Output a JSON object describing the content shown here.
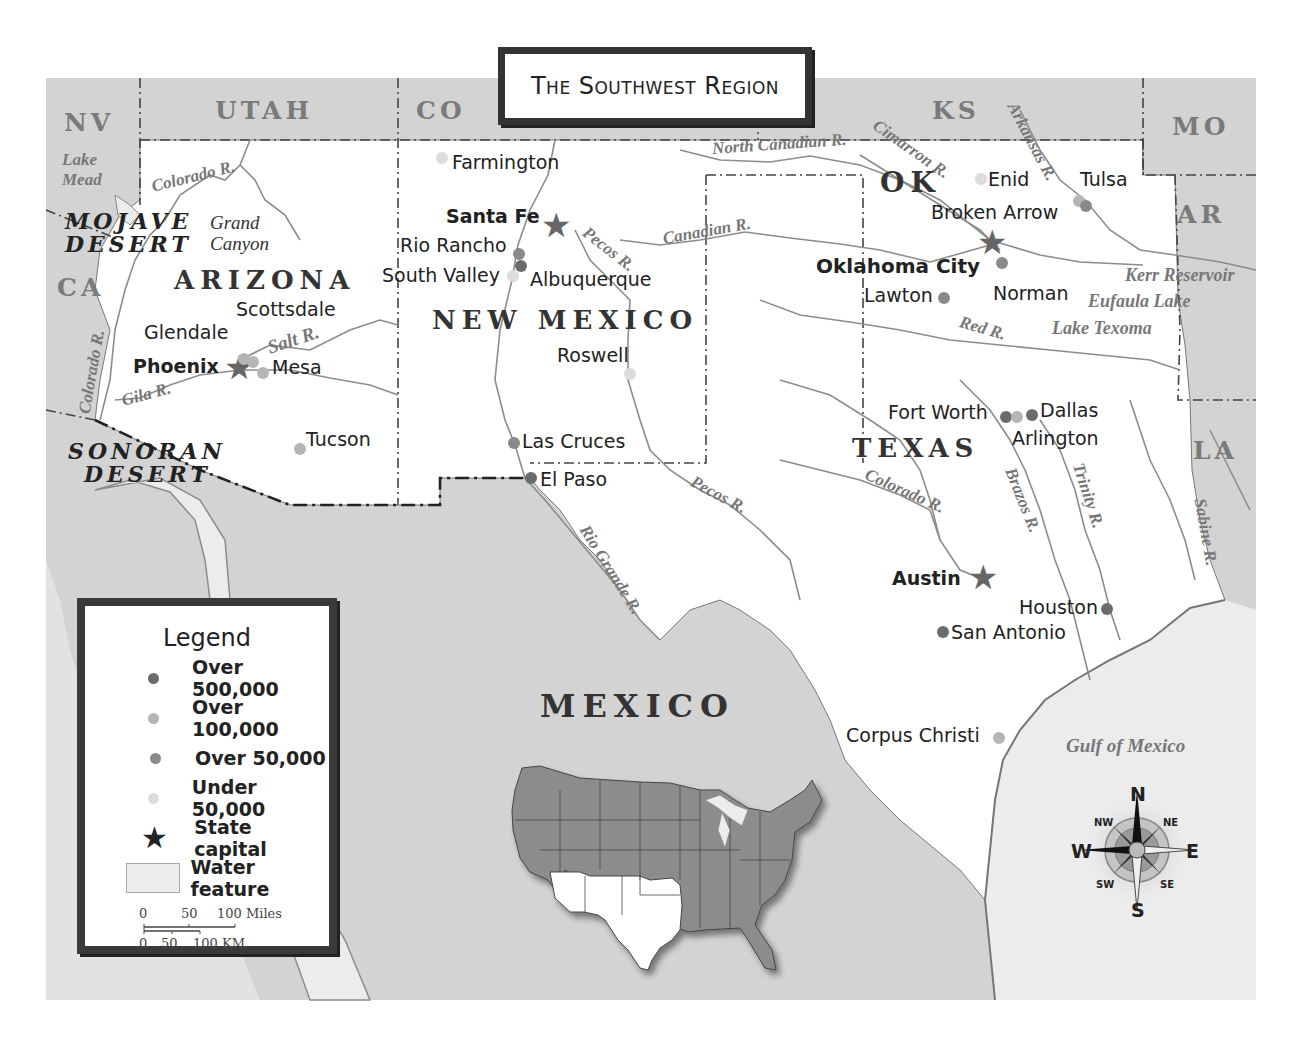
{
  "title": "The Southwest Region",
  "colors": {
    "outside_land": "#d3d3d3",
    "region_land": "#ffffff",
    "water": "#ececec",
    "river": "#8c8c8c",
    "border": "#444444",
    "dot_over_500000": "#6b6b6b",
    "dot_over_100000": "#b5b5b5",
    "dot_over_50000": "#8a8a8a",
    "dot_under_50000": "#dcdcdc",
    "capital_star": "#666666"
  },
  "neighbor_states": {
    "nv": "NV",
    "utah": "UTAH",
    "co": "CO",
    "ks": "KS",
    "mo": "MO",
    "ar": "AR",
    "la": "LA",
    "ca": "CA"
  },
  "region_states": {
    "arizona": "ARIZONA",
    "new_mexico": "NEW MEXICO",
    "ok": "OK",
    "texas": "TEXAS"
  },
  "country": "MEXICO",
  "deserts": {
    "mojave": [
      "MOJAVE",
      "DESERT"
    ],
    "sonoran": [
      "SONORAN",
      "DESERT"
    ]
  },
  "features": {
    "grand_canyon": [
      "Grand",
      "Canyon"
    ],
    "lake_mead": [
      "Lake",
      "Mead"
    ]
  },
  "rivers": {
    "colorado_az": "Colorado R.",
    "colorado_west": "Colorado R.",
    "gila": "Gila R.",
    "salt": "Salt R.",
    "pecos_nm": "Pecos R.",
    "pecos_tx": "Pecos R.",
    "rio_grande": "Rio Grande R.",
    "canadian": "Canadian R.",
    "north_canadian": "North Canadian R.",
    "cimarron": "Cimarron R.",
    "arkansas": "Arkansas R.",
    "red": "Red R.",
    "colorado_tx": "Colorado R.",
    "brazos": "Brazos R.",
    "trinity": "Trinity R.",
    "sabine": "Sabine R."
  },
  "water_bodies": {
    "kerr": "Kerr Reservoir",
    "eufaula": "Eufaula Lake",
    "texoma": "Lake Texoma",
    "gulf": "Gulf of Mexico"
  },
  "cities": {
    "phoenix": {
      "name": "Phoenix",
      "tier": "capital"
    },
    "glendale": {
      "name": "Glendale",
      "tier": "over_100000"
    },
    "scottsdale": {
      "name": "Scottsdale",
      "tier": "over_100000"
    },
    "mesa": {
      "name": "Mesa",
      "tier": "over_100000"
    },
    "tucson": {
      "name": "Tucson",
      "tier": "over_100000"
    },
    "farmington": {
      "name": "Farmington",
      "tier": "under_50000"
    },
    "santa_fe": {
      "name": "Santa Fe",
      "tier": "capital"
    },
    "rio_rancho": {
      "name": "Rio Rancho",
      "tier": "over_50000"
    },
    "south_valley": {
      "name": "South Valley",
      "tier": "under_50000"
    },
    "albuquerque": {
      "name": "Albuquerque",
      "tier": "over_500000"
    },
    "roswell": {
      "name": "Roswell",
      "tier": "under_50000"
    },
    "las_cruces": {
      "name": "Las Cruces",
      "tier": "over_50000"
    },
    "el_paso": {
      "name": "El Paso",
      "tier": "over_500000"
    },
    "enid": {
      "name": "Enid",
      "tier": "under_50000"
    },
    "tulsa": {
      "name": "Tulsa",
      "tier": "over_100000"
    },
    "broken_arrow": {
      "name": "Broken Arrow",
      "tier": "over_50000"
    },
    "oklahoma_city": {
      "name": "Oklahoma City",
      "tier": "capital"
    },
    "norman": {
      "name": "Norman",
      "tier": "over_50000"
    },
    "lawton": {
      "name": "Lawton",
      "tier": "over_50000"
    },
    "fort_worth": {
      "name": "Fort Worth",
      "tier": "over_500000"
    },
    "arlington": {
      "name": "Arlington",
      "tier": "over_100000"
    },
    "dallas": {
      "name": "Dallas",
      "tier": "over_500000"
    },
    "austin": {
      "name": "Austin",
      "tier": "capital"
    },
    "houston": {
      "name": "Houston",
      "tier": "over_500000"
    },
    "san_antonio": {
      "name": "San Antonio",
      "tier": "over_500000"
    },
    "corpus_christi": {
      "name": "Corpus Christi",
      "tier": "over_100000"
    }
  },
  "legend": {
    "title": "Legend",
    "items": [
      {
        "symbol": "dot",
        "color": "#6b6b6b",
        "label": "Over 500,000"
      },
      {
        "symbol": "dot",
        "color": "#b5b5b5",
        "label": "Over 100,000"
      },
      {
        "symbol": "dot",
        "color": "#8a8a8a",
        "label": "Over 50,000"
      },
      {
        "symbol": "dot",
        "color": "#dcdcdc",
        "label": "Under 50,000"
      },
      {
        "symbol": "star",
        "color": "#222222",
        "label": "State capital"
      },
      {
        "symbol": "water",
        "color": "#ededed",
        "label": "Water feature"
      }
    ],
    "scale": {
      "miles_ticks": [
        "0",
        "50",
        "100 Miles"
      ],
      "km_ticks": [
        "0",
        "50",
        "100 KM"
      ]
    }
  },
  "compass": {
    "n": "N",
    "s": "S",
    "e": "E",
    "w": "W",
    "ne": "NE",
    "nw": "NW",
    "se": "SE",
    "sw": "SW"
  }
}
